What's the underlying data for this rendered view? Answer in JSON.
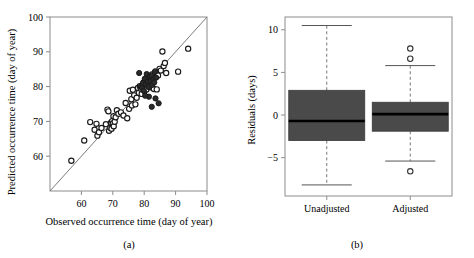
{
  "figure": {
    "panel_a_caption": "(a)",
    "panel_b_caption": "(b)"
  },
  "chart_data": [
    {
      "type": "scatter",
      "panel": "(a)",
      "title": "",
      "xlabel": "Observed occurrence time  (day of year)",
      "ylabel": "Predicted occurrence time  (day of year)",
      "xlim": [
        50,
        100
      ],
      "ylim": [
        50,
        100
      ],
      "xticks": [
        60,
        70,
        80,
        90,
        100
      ],
      "yticks": [
        60,
        70,
        80,
        90,
        100
      ],
      "xticklabels": [
        "60",
        "70",
        "80",
        "90",
        "100"
      ],
      "yticklabels": [
        "60",
        "70",
        "80",
        "90",
        "100"
      ],
      "grid": false,
      "legend": false,
      "annotations": [
        "1:1 reference line from (50,50) to (100,100)"
      ],
      "reference_line": {
        "type": "identity",
        "from": [
          50,
          50
        ],
        "to": [
          100,
          100
        ]
      },
      "series": [
        {
          "name": "open-circles",
          "marker": "open circle",
          "points": [
            [
              56.8,
              58.7
            ],
            [
              60.9,
              64.5
            ],
            [
              62.8,
              69.8
            ],
            [
              64.2,
              67.6
            ],
            [
              64.8,
              69.3
            ],
            [
              65.1,
              65.9
            ],
            [
              65.6,
              66.9
            ],
            [
              66.4,
              68.1
            ],
            [
              67.8,
              69.2
            ],
            [
              68.3,
              73.4
            ],
            [
              68.6,
              72.9
            ],
            [
              68.8,
              67.3
            ],
            [
              69.2,
              68.2
            ],
            [
              69.4,
              69.6
            ],
            [
              69.6,
              67.9
            ],
            [
              69.8,
              70.1
            ],
            [
              70.0,
              69.4
            ],
            [
              70.2,
              71.5
            ],
            [
              70.3,
              68.6
            ],
            [
              70.6,
              69.9
            ],
            [
              70.9,
              71.2
            ],
            [
              71.3,
              73.2
            ],
            [
              71.8,
              72.2
            ],
            [
              72.6,
              72.6
            ],
            [
              73.4,
              71.7
            ],
            [
              74.1,
              75.3
            ],
            [
              74.6,
              70.9
            ],
            [
              75.2,
              73.6
            ],
            [
              75.4,
              78.8
            ],
            [
              75.9,
              76.4
            ],
            [
              76.1,
              74.6
            ],
            [
              76.4,
              79.1
            ],
            [
              76.8,
              77.5
            ],
            [
              77.2,
              74.9
            ],
            [
              77.6,
              76.8
            ],
            [
              78.0,
              79.6
            ],
            [
              78.3,
              78.2
            ],
            [
              78.6,
              80.1
            ],
            [
              78.9,
              79.4
            ],
            [
              79.2,
              77.9
            ],
            [
              79.5,
              79.9
            ],
            [
              79.8,
              81.2
            ],
            [
              80.1,
              78.7
            ],
            [
              80.4,
              80.6
            ],
            [
              80.7,
              79.2
            ],
            [
              81.0,
              81.8
            ],
            [
              81.3,
              80.3
            ],
            [
              81.6,
              82.4
            ],
            [
              81.9,
              79.8
            ],
            [
              82.2,
              81.1
            ],
            [
              82.5,
              83.5
            ],
            [
              82.8,
              82.0
            ],
            [
              83.1,
              79.3
            ],
            [
              83.4,
              84.1
            ],
            [
              83.7,
              82.7
            ],
            [
              84.0,
              79.2
            ],
            [
              84.4,
              83.2
            ],
            [
              84.9,
              85.1
            ],
            [
              85.3,
              84.6
            ],
            [
              85.8,
              90.1
            ],
            [
              86.2,
              85.9
            ],
            [
              86.6,
              86.8
            ],
            [
              87.0,
              83.9
            ],
            [
              90.8,
              84.3
            ],
            [
              94.0,
              90.9
            ]
          ]
        },
        {
          "name": "filled-circles",
          "marker": "filled circle",
          "points": [
            [
              78.4,
              83.9
            ],
            [
              78.9,
              80.0
            ],
            [
              79.3,
              79.6
            ],
            [
              79.6,
              81.0
            ],
            [
              79.9,
              78.8
            ],
            [
              80.2,
              82.3
            ],
            [
              80.5,
              80.7
            ],
            [
              80.8,
              83.6
            ],
            [
              81.1,
              81.4
            ],
            [
              81.4,
              79.9
            ],
            [
              81.7,
              82.8
            ],
            [
              82.0,
              81.6
            ],
            [
              82.3,
              83.1
            ],
            [
              82.6,
              80.5
            ],
            [
              82.9,
              82.1
            ],
            [
              83.2,
              81.2
            ],
            [
              83.5,
              84.4
            ],
            [
              83.8,
              82.6
            ],
            [
              81.5,
              77.1
            ],
            [
              82.4,
              74.2
            ],
            [
              83.6,
              76.6
            ],
            [
              84.6,
              75.2
            ],
            [
              80.3,
              77.4
            ]
          ]
        }
      ]
    },
    {
      "type": "boxplot",
      "panel": "(b)",
      "title": "",
      "xlabel": "",
      "ylabel": "Residuals  (days)",
      "ylim": [
        -9.5,
        11.5
      ],
      "yticks": [
        10,
        5,
        0,
        -5
      ],
      "yticklabels": [
        "10",
        "5",
        "0",
        "−5"
      ],
      "categories": [
        "Unadjusted",
        "Adjusted"
      ],
      "grid": false,
      "legend": false,
      "boxes": [
        {
          "label": "Unadjusted",
          "whisker_low": -8.2,
          "q1": -3.0,
          "median": -0.7,
          "q3": 2.9,
          "whisker_high": 10.5,
          "outliers": []
        },
        {
          "label": "Adjusted",
          "whisker_low": -5.4,
          "q1": -1.9,
          "median": 0.1,
          "q3": 1.5,
          "whisker_high": 5.8,
          "outliers": [
            7.8,
            6.6,
            -6.6
          ]
        }
      ]
    }
  ]
}
